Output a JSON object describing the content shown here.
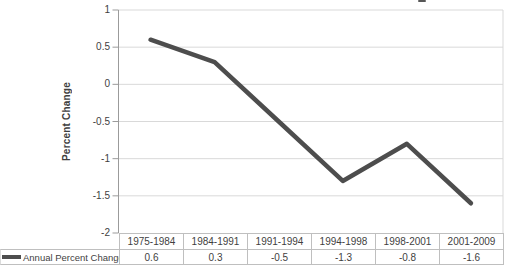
{
  "chart_data": {
    "type": "line",
    "categories": [
      "1975-1984",
      "1984-1991",
      "1991-1994",
      "1994-1998",
      "1998-2001",
      "2001-2009"
    ],
    "series": [
      {
        "name": "Annual Percent Change",
        "values": [
          0.6,
          0.3,
          -0.5,
          -1.3,
          -0.8,
          -1.6
        ]
      }
    ],
    "title": "",
    "xlabel": "",
    "ylabel": "Percent Change",
    "ylim": [
      -2,
      1
    ],
    "yticks": [
      1,
      0.5,
      0,
      -0.5,
      -1,
      -1.5,
      -2
    ],
    "grid": true,
    "legend_position": "bottom-left-table",
    "line_color": "#4d4d4d",
    "gridline_color": "#d9d9d9",
    "axis_color": "#9b9b9b",
    "border_color": "#bfbfbf",
    "text_color": "#3f3f3f"
  },
  "table": {
    "legend_label": "Annual Percent Change",
    "categories": [
      "1975-1984",
      "1984-1991",
      "1991-1994",
      "1994-1998",
      "1998-2001",
      "2001-2009"
    ],
    "values": [
      "0.6",
      "0.3",
      "-0.5",
      "-1.3",
      "-0.8",
      "-1.6"
    ]
  }
}
